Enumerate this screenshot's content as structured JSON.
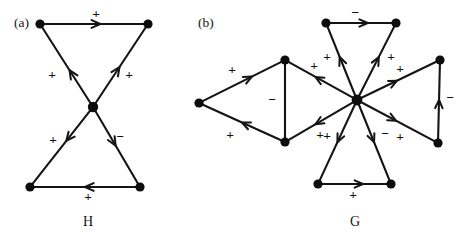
{
  "figure": {
    "panels": [
      {
        "tag": "(a)",
        "tag_x": 14,
        "tag_y": 24,
        "name": "H",
        "name_x": 88,
        "name_y": 223,
        "nodes": [
          {
            "id": "h-top-left",
            "x": 40,
            "y": 24,
            "r": 4.6
          },
          {
            "id": "h-top-right",
            "x": 148,
            "y": 24,
            "r": 4.6
          },
          {
            "id": "h-center",
            "x": 93,
            "y": 107,
            "r": 5.2
          },
          {
            "id": "h-bottom-left",
            "x": 30,
            "y": 187,
            "r": 4.6
          },
          {
            "id": "h-bottom-right",
            "x": 140,
            "y": 187,
            "r": 4.6
          }
        ],
        "edges": [
          {
            "id": "h-edge-tl-tr",
            "from": "h-top-left",
            "to": "h-top-right",
            "sign": "+",
            "label_x": 96,
            "label_y": 15,
            "arrow_t": 0.56,
            "arrow_size": 9.5
          },
          {
            "id": "h-edge-c-tl",
            "from": "h-center",
            "to": "h-top-left",
            "sign": "+",
            "label_x": 52,
            "label_y": 76,
            "arrow_t": 0.44,
            "arrow_size": 9.5
          },
          {
            "id": "h-edge-c-tr",
            "from": "h-center",
            "to": "h-top-right",
            "sign": "+",
            "label_x": 129,
            "label_y": 76,
            "arrow_t": 0.48,
            "arrow_size": 9.5
          },
          {
            "id": "h-edge-c-bl",
            "from": "h-center",
            "to": "h-bottom-left",
            "sign": "+",
            "label_x": 53,
            "label_y": 141,
            "arrow_t": 0.42,
            "arrow_size": 9.5
          },
          {
            "id": "h-edge-c-br",
            "from": "h-center",
            "to": "h-bottom-right",
            "sign": "−",
            "label_x": 120,
            "label_y": 138,
            "arrow_t": 0.48,
            "arrow_size": 9.5
          },
          {
            "id": "h-edge-br-bl",
            "from": "h-bottom-right",
            "to": "h-bottom-left",
            "sign": "+",
            "label_x": 88,
            "label_y": 198,
            "arrow_t": 0.5,
            "arrow_size": 9.5
          }
        ]
      },
      {
        "tag": "(b)",
        "tag_x": 198,
        "tag_y": 24,
        "name": "G",
        "name_x": 355,
        "name_y": 223,
        "nodes": [
          {
            "id": "g-hub",
            "x": 357,
            "y": 100,
            "r": 5.4
          },
          {
            "id": "g-far-left",
            "x": 199,
            "y": 103,
            "r": 4.6
          },
          {
            "id": "g-left-upper",
            "x": 285,
            "y": 60,
            "r": 4.6
          },
          {
            "id": "g-left-lower",
            "x": 285,
            "y": 142,
            "r": 4.6
          },
          {
            "id": "g-top-left",
            "x": 326,
            "y": 23,
            "r": 4.6
          },
          {
            "id": "g-top-right",
            "x": 396,
            "y": 23,
            "r": 4.6
          },
          {
            "id": "g-right-upper",
            "x": 440,
            "y": 60,
            "r": 4.6
          },
          {
            "id": "g-right-lower",
            "x": 438,
            "y": 143,
            "r": 4.6
          },
          {
            "id": "g-bottom-left",
            "x": 318,
            "y": 184,
            "r": 4.6
          },
          {
            "id": "g-bottom-right",
            "x": 391,
            "y": 184,
            "r": 4.6
          }
        ],
        "edges": [
          {
            "id": "g-edge-farleft-leftupper",
            "from": "g-far-left",
            "to": "g-left-upper",
            "sign": "+",
            "label_x": 232,
            "label_y": 71,
            "arrow_t": 0.62,
            "arrow_size": 9.0
          },
          {
            "id": "g-edge-leftlower-farleft",
            "from": "g-left-lower",
            "to": "g-far-left",
            "sign": "+",
            "label_x": 230,
            "label_y": 136,
            "arrow_t": 0.5,
            "arrow_size": 9.0
          },
          {
            "id": "g-edge-leftupper-leftlower",
            "from": "g-left-upper",
            "to": "g-left-lower",
            "sign": "−",
            "label_x": 272,
            "label_y": 101,
            "arrow_t": 0.0,
            "arrow_size": 0
          },
          {
            "id": "g-edge-hub-leftupper",
            "from": "g-hub",
            "to": "g-left-upper",
            "sign": "+",
            "label_x": 314,
            "label_y": 67,
            "arrow_t": 0.58,
            "arrow_size": 9.0
          },
          {
            "id": "g-edge-hub-leftlower",
            "from": "g-hub",
            "to": "g-left-lower",
            "sign": "+",
            "label_x": 320,
            "label_y": 136,
            "arrow_t": 0.58,
            "arrow_size": 9.0
          },
          {
            "id": "g-edge-topleft-topright",
            "from": "g-top-left",
            "to": "g-top-right",
            "sign": "−",
            "label_x": 355,
            "label_y": 14,
            "arrow_t": 0.6,
            "arrow_size": 9.0
          },
          {
            "id": "g-edge-hub-topleft",
            "from": "g-hub",
            "to": "g-top-left",
            "sign": "+",
            "label_x": 327,
            "label_y": 58,
            "arrow_t": 0.56,
            "arrow_size": 9.0
          },
          {
            "id": "g-edge-hub-topright",
            "from": "g-hub",
            "to": "g-top-right",
            "sign": "+",
            "label_x": 391,
            "label_y": 58,
            "arrow_t": 0.56,
            "arrow_size": 9.0
          },
          {
            "id": "g-edge-hub-rightupper",
            "from": "g-hub",
            "to": "g-right-upper",
            "sign": "+",
            "label_x": 400,
            "label_y": 70,
            "arrow_t": 0.48,
            "arrow_size": 9.0
          },
          {
            "id": "g-edge-hub-rightlower",
            "from": "g-hub",
            "to": "g-right-lower",
            "sign": "+",
            "label_x": 400,
            "label_y": 138,
            "arrow_t": 0.48,
            "arrow_size": 9.0
          },
          {
            "id": "g-edge-rightlower-rightupper",
            "from": "g-right-lower",
            "to": "g-right-upper",
            "sign": "−",
            "label_x": 450,
            "label_y": 99,
            "arrow_t": 0.52,
            "arrow_size": 9.0
          },
          {
            "id": "g-edge-hub-bottomleft",
            "from": "g-hub",
            "to": "g-bottom-left",
            "sign": "+",
            "label_x": 327,
            "label_y": 137,
            "arrow_t": 0.5,
            "arrow_size": 9.0
          },
          {
            "id": "g-edge-hub-bottomright",
            "from": "g-hub",
            "to": "g-bottom-right",
            "sign": "−",
            "label_x": 385,
            "label_y": 135,
            "arrow_t": 0.5,
            "arrow_size": 9.0
          },
          {
            "id": "g-edge-bottomleft-bottomright",
            "from": "g-bottom-left",
            "to": "g-bottom-right",
            "sign": "+",
            "label_x": 353,
            "label_y": 196,
            "arrow_t": 0.62,
            "arrow_size": 9.0
          }
        ]
      }
    ]
  }
}
